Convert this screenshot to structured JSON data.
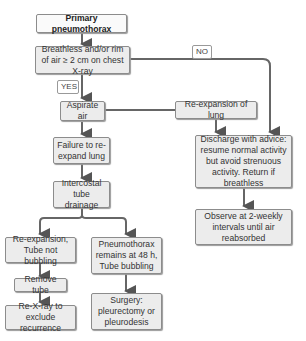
{
  "nodes": {
    "primary": "Primary pneumothorax",
    "breathless": "Breathless and/or rim of air ≥ 2 cm on chest X-ray",
    "aspirate": "Aspirate air",
    "reexpansion_lung": "Re-expansion of lung",
    "failure": "Failure to re-expand lung",
    "intercostal": "Intercostal tube drainage",
    "discharge": "Discharge with advice: resume normal activity but avoid strenuous activity. Return if breathless",
    "observe": "Observe at 2-weekly intervals until air reabsorbed",
    "reexp_tube": "Re-expansion, Tube not bubbling",
    "pneumo_remains": "Pneumothorax remains at 48 h, Tube bubbling",
    "remove_tube": "Remove tube",
    "rexray": "Re-X-ray to exclude recurrence",
    "surgery": "Surgery: pleurectomy or pleurodesis"
  },
  "edge_labels": {
    "yes": "YES",
    "no": "NO"
  }
}
